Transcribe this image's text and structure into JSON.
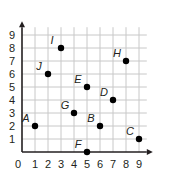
{
  "chart_data": {
    "type": "scatter",
    "title": "",
    "xlabel": "",
    "ylabel": "",
    "xlim": [
      0,
      9
    ],
    "ylim": [
      0,
      9
    ],
    "grid": true,
    "x_ticks": [
      "0",
      "1",
      "2",
      "3",
      "4",
      "5",
      "6",
      "7",
      "8",
      "9"
    ],
    "y_ticks": [
      "1",
      "2",
      "3",
      "4",
      "5",
      "6",
      "7",
      "8",
      "9"
    ],
    "points": [
      {
        "label": "A",
        "x": 1,
        "y": 2
      },
      {
        "label": "B",
        "x": 6,
        "y": 2
      },
      {
        "label": "C",
        "x": 9,
        "y": 1
      },
      {
        "label": "D",
        "x": 7,
        "y": 4
      },
      {
        "label": "E",
        "x": 5,
        "y": 5
      },
      {
        "label": "F",
        "x": 5,
        "y": 0
      },
      {
        "label": "G",
        "x": 4,
        "y": 3
      },
      {
        "label": "H",
        "x": 8,
        "y": 7
      },
      {
        "label": "I",
        "x": 3,
        "y": 8
      },
      {
        "label": "J",
        "x": 2,
        "y": 6
      }
    ]
  },
  "colors": {
    "grid": "#c8c8c8",
    "axis": "#231f20",
    "point": "#000000"
  }
}
